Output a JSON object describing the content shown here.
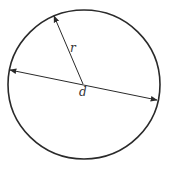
{
  "diagram": {
    "labels": {
      "radius": "r",
      "diameter": "d"
    },
    "colors": {
      "stroke": "#2a2a2a",
      "text": "#333333",
      "background": "#ffffff"
    }
  }
}
